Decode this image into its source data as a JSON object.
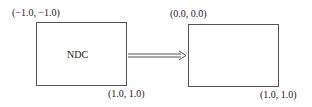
{
  "diagram": {
    "left_box": {
      "top_left_label": "(−1.0, −1.0)",
      "bottom_right_label": "(1.0, 1.0)",
      "center_label": "NDC"
    },
    "right_box": {
      "top_left_label": "(0.0, 0.0)",
      "bottom_right_label": "(1.0, 1.0)"
    },
    "arrow": {
      "type": "double-line-arrow",
      "direction": "right"
    },
    "colors": {
      "stroke": "#555555",
      "text": "#222222"
    }
  }
}
